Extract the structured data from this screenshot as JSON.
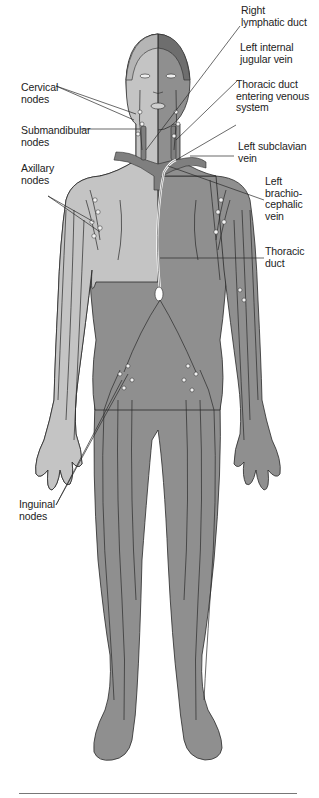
{
  "figure": {
    "colors": {
      "body_dark": "#8f8f8f",
      "body_light": "#c4c4c4",
      "hair_dark": "#6e6e6e",
      "vessel_line": "#2a2a2a",
      "node_fill": "#f2f2f2",
      "vein_fill": "#7f7f7f",
      "label_text": "#222222"
    },
    "labels_left": [
      {
        "id": "cervical",
        "text": "Cervical\nnodes"
      },
      {
        "id": "submandibular",
        "text": "Submandibular\nnodes"
      },
      {
        "id": "axillary",
        "text": "Axillary\nnodes"
      },
      {
        "id": "inguinal",
        "text": "Inguinal\nnodes"
      }
    ],
    "labels_right": [
      {
        "id": "right-lymphatic-duct",
        "text": "Right\nlymphatic duct"
      },
      {
        "id": "left-internal-jugular-vein",
        "text": "Left internal\njugular vein"
      },
      {
        "id": "thoracic-duct-entering",
        "text": "Thoracic duct\nentering venous\nsystem"
      },
      {
        "id": "left-subclavian-vein",
        "text": "Left subclavian\nvein"
      },
      {
        "id": "left-brachiocephalic-vein",
        "text": "Left\nbrachio-\ncephalic\nvein"
      },
      {
        "id": "thoracic-duct",
        "text": "Thoracic\nduct"
      }
    ]
  }
}
